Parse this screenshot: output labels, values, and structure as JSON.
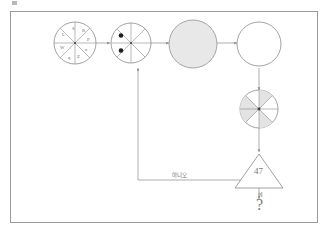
{
  "page": {
    "background_color": "#ffffff",
    "border_color": "#9a9a9a",
    "ink_color": "#8a8a8a",
    "shade_color": "#e8e8e8"
  },
  "diagram": {
    "type": "flowchart",
    "nodes": [
      {
        "id": "wheel-lettered",
        "kind": "segmented-circle",
        "segments": 8,
        "labels": [
          "S",
          "R",
          "P",
          "n",
          "Z",
          "q",
          "W",
          "L"
        ],
        "filled": false
      },
      {
        "id": "wheel-dots",
        "kind": "segmented-circle",
        "segments": 8,
        "dots": 2,
        "filled": false
      },
      {
        "id": "circle-shaded",
        "kind": "circle",
        "filled": true
      },
      {
        "id": "circle-empty",
        "kind": "circle",
        "filled": false
      },
      {
        "id": "wheel-alternating",
        "kind": "segmented-circle",
        "segments": 8,
        "filled": "alternating"
      },
      {
        "id": "triangle-decision",
        "kind": "triangle",
        "value": "47"
      },
      {
        "id": "terminal-question",
        "kind": "text",
        "value": "?"
      }
    ],
    "edges": [
      {
        "from": "wheel-lettered",
        "to": "wheel-dots",
        "label": ""
      },
      {
        "from": "wheel-dots",
        "to": "circle-shaded",
        "label": ""
      },
      {
        "from": "circle-shaded",
        "to": "circle-empty",
        "label": ""
      },
      {
        "from": "circle-empty",
        "to": "wheel-alternating",
        "label": ""
      },
      {
        "from": "wheel-alternating",
        "to": "triangle-decision",
        "label": ""
      },
      {
        "from": "triangle-decision",
        "to": "wheel-dots",
        "label": "아니오"
      },
      {
        "from": "triangle-decision",
        "to": "terminal-question",
        "label": "예"
      }
    ]
  },
  "labels": {
    "triangle_value": "47",
    "feedback": "아니오",
    "yes": "예",
    "question": "?",
    "wheel_letters": [
      "S",
      "R",
      "P",
      "n",
      "Z",
      "q",
      "W",
      "L"
    ]
  }
}
